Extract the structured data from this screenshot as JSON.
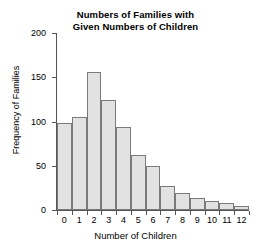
{
  "chart_data": {
    "type": "bar",
    "title": "Numbers of Families with Given Numbers of Children",
    "title_line1": "Numbers of Families with",
    "title_line2": "Given Numbers of Children",
    "xlabel": "Number of Children",
    "ylabel": "Frequency of Families",
    "categories": [
      "0",
      "1",
      "2",
      "3",
      "4",
      "5",
      "6",
      "7",
      "8",
      "9",
      "10",
      "11",
      "12"
    ],
    "values": [
      98,
      105,
      156,
      124,
      94,
      62,
      50,
      27,
      19,
      14,
      10,
      8,
      5
    ],
    "ylim": [
      0,
      200
    ],
    "yticks": [
      "0",
      "50",
      "100",
      "150",
      "200"
    ],
    "ytick_values": [
      0,
      50,
      100,
      150,
      200
    ],
    "grid": false,
    "legend": "none",
    "bar_fill_color": "#e2e2e2",
    "bar_border_color": "#7a7a7a",
    "axis_color": "#555555",
    "background_color": "#ffffff"
  }
}
